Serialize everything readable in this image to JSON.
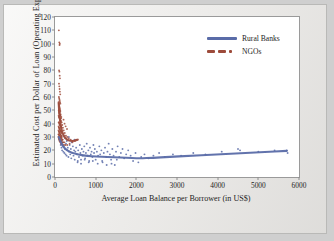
{
  "chart_data": {
    "type": "scatter",
    "title": "",
    "xlabel": "Average Loan Balance per Borrower (in US$)",
    "ylabel": "Estimated Cost per Dollar of Loan (Operating Expense Ratio)",
    "xlim": [
      0,
      6000
    ],
    "ylim": [
      0,
      120
    ],
    "xticks": [
      0,
      1000,
      2000,
      3000,
      4000,
      5000,
      6000
    ],
    "yticks": [
      0,
      10,
      20,
      30,
      40,
      50,
      60,
      70,
      80,
      90,
      100,
      110,
      120
    ],
    "grid": false,
    "legend_position": "top-right",
    "legend": [
      {
        "name": "Rural Banks",
        "color": "#5a6ca8",
        "style": "solid-line"
      },
      {
        "name": "NGOs",
        "color": "#9d4b3b",
        "style": "dashed-line"
      }
    ],
    "series": [
      {
        "name": "Rural Banks",
        "color": "#5a6ca8",
        "marker": "dot",
        "points": [
          [
            120,
            27
          ],
          [
            140,
            24
          ],
          [
            160,
            22
          ],
          [
            175,
            20
          ],
          [
            190,
            26
          ],
          [
            205,
            19
          ],
          [
            215,
            23
          ],
          [
            230,
            18
          ],
          [
            245,
            21
          ],
          [
            260,
            17
          ],
          [
            270,
            25
          ],
          [
            285,
            16
          ],
          [
            300,
            20
          ],
          [
            315,
            22
          ],
          [
            330,
            15
          ],
          [
            345,
            19
          ],
          [
            360,
            24
          ],
          [
            375,
            17
          ],
          [
            390,
            21
          ],
          [
            400,
            14
          ],
          [
            420,
            18
          ],
          [
            440,
            23
          ],
          [
            455,
            16
          ],
          [
            470,
            20
          ],
          [
            485,
            13
          ],
          [
            500,
            19
          ],
          [
            520,
            22
          ],
          [
            540,
            17
          ],
          [
            555,
            11
          ],
          [
            570,
            20
          ],
          [
            590,
            15
          ],
          [
            610,
            24
          ],
          [
            625,
            18
          ],
          [
            640,
            13
          ],
          [
            660,
            21
          ],
          [
            680,
            16
          ],
          [
            700,
            19
          ],
          [
            720,
            23
          ],
          [
            740,
            14
          ],
          [
            760,
            18
          ],
          [
            780,
            25
          ],
          [
            800,
            16
          ],
          [
            820,
            20
          ],
          [
            840,
            12
          ],
          [
            860,
            22
          ],
          [
            880,
            17
          ],
          [
            900,
            19
          ],
          [
            920,
            15
          ],
          [
            945,
            24
          ],
          [
            960,
            18
          ],
          [
            980,
            21
          ],
          [
            1000,
            13
          ],
          [
            1030,
            19
          ],
          [
            1060,
            16
          ],
          [
            1090,
            23
          ],
          [
            1110,
            17
          ],
          [
            1140,
            20
          ],
          [
            1170,
            11
          ],
          [
            1200,
            18
          ],
          [
            1230,
            22
          ],
          [
            1260,
            15
          ],
          [
            1290,
            19
          ],
          [
            1320,
            25
          ],
          [
            1350,
            17
          ],
          [
            1380,
            13
          ],
          [
            1410,
            21
          ],
          [
            1440,
            16
          ],
          [
            1470,
            9
          ],
          [
            1500,
            19
          ],
          [
            1540,
            23
          ],
          [
            1580,
            15
          ],
          [
            1620,
            18
          ],
          [
            1660,
            21
          ],
          [
            1700,
            14
          ],
          [
            1750,
            17
          ],
          [
            1800,
            20
          ],
          [
            1860,
            16
          ],
          [
            1920,
            12
          ],
          [
            1980,
            18
          ],
          [
            2050,
            11
          ],
          [
            2120,
            15
          ],
          [
            2200,
            17
          ],
          [
            2300,
            14
          ],
          [
            2420,
            16
          ],
          [
            2560,
            18
          ],
          [
            2700,
            15
          ],
          [
            2900,
            17
          ],
          [
            3100,
            16
          ],
          [
            3400,
            18
          ],
          [
            3700,
            17
          ],
          [
            4100,
            19
          ],
          [
            4500,
            21
          ],
          [
            4550,
            20
          ],
          [
            5000,
            19
          ],
          [
            5400,
            20
          ],
          [
            5700,
            20
          ],
          [
            5720,
            18
          ],
          [
            150,
            30
          ],
          [
            180,
            28
          ],
          [
            210,
            31
          ],
          [
            250,
            29
          ],
          [
            290,
            27
          ],
          [
            340,
            30
          ],
          [
            410,
            26
          ],
          [
            480,
            28
          ],
          [
            560,
            12
          ],
          [
            640,
            10
          ],
          [
            730,
            13
          ],
          [
            830,
            11
          ],
          [
            930,
            12
          ],
          [
            1050,
            10
          ],
          [
            1160,
            12
          ],
          [
            1270,
            9
          ],
          [
            1390,
            10
          ],
          [
            1520,
            13
          ]
        ],
        "trend": {
          "type": "fitted-curve",
          "color": "#5a6ca8",
          "points": [
            [
              95,
              30
            ],
            [
              150,
              25.5
            ],
            [
              220,
              22
            ],
            [
              320,
              19.5
            ],
            [
              450,
              17.8
            ],
            [
              600,
              16.6
            ],
            [
              800,
              15.8
            ],
            [
              1000,
              15.3
            ],
            [
              1300,
              15.0
            ],
            [
              1600,
              14.6
            ],
            [
              1900,
              14.2
            ],
            [
              2100,
              14.0
            ],
            [
              2400,
              14.4
            ],
            [
              2800,
              15.1
            ],
            [
              3300,
              15.9
            ],
            [
              3900,
              16.8
            ],
            [
              4500,
              17.7
            ],
            [
              5100,
              18.7
            ],
            [
              5700,
              19.6
            ]
          ]
        }
      },
      {
        "name": "NGOs",
        "color": "#9d4b3b",
        "marker": "dot",
        "points": [
          [
            95,
            110
          ],
          [
            105,
            101
          ],
          [
            112,
            99
          ],
          [
            118,
            100
          ],
          [
            100,
            80
          ],
          [
            108,
            79
          ],
          [
            115,
            76
          ],
          [
            122,
            74
          ],
          [
            98,
            70
          ],
          [
            106,
            68
          ],
          [
            113,
            66
          ],
          [
            120,
            64
          ],
          [
            128,
            62
          ],
          [
            96,
            60
          ],
          [
            104,
            59
          ],
          [
            110,
            58
          ],
          [
            116,
            57
          ],
          [
            124,
            56
          ],
          [
            132,
            55
          ],
          [
            94,
            55
          ],
          [
            101,
            54
          ],
          [
            108,
            53
          ],
          [
            114,
            52
          ],
          [
            121,
            51
          ],
          [
            129,
            50
          ],
          [
            92,
            50
          ],
          [
            99,
            49
          ],
          [
            106,
            48
          ],
          [
            112,
            48
          ],
          [
            119,
            47
          ],
          [
            126,
            46
          ],
          [
            134,
            46
          ],
          [
            90,
            46
          ],
          [
            97,
            45
          ],
          [
            104,
            45
          ],
          [
            111,
            44
          ],
          [
            117,
            44
          ],
          [
            124,
            43
          ],
          [
            131,
            43
          ],
          [
            138,
            42
          ],
          [
            146,
            42
          ],
          [
            90,
            41
          ],
          [
            98,
            41
          ],
          [
            105,
            40
          ],
          [
            112,
            40
          ],
          [
            119,
            39
          ],
          [
            127,
            39
          ],
          [
            135,
            38
          ],
          [
            143,
            38
          ],
          [
            152,
            37
          ],
          [
            88,
            38
          ],
          [
            95,
            37
          ],
          [
            103,
            37
          ],
          [
            110,
            36
          ],
          [
            118,
            36
          ],
          [
            126,
            35
          ],
          [
            134,
            35
          ],
          [
            142,
            34
          ],
          [
            151,
            34
          ],
          [
            160,
            33
          ],
          [
            86,
            35
          ],
          [
            94,
            34
          ],
          [
            102,
            34
          ],
          [
            110,
            33
          ],
          [
            119,
            33
          ],
          [
            128,
            32
          ],
          [
            137,
            32
          ],
          [
            147,
            31
          ],
          [
            157,
            31
          ],
          [
            168,
            30
          ],
          [
            85,
            32
          ],
          [
            93,
            32
          ],
          [
            102,
            31
          ],
          [
            112,
            31
          ],
          [
            122,
            30
          ],
          [
            133,
            30
          ],
          [
            145,
            29
          ],
          [
            158,
            29
          ],
          [
            172,
            28
          ],
          [
            188,
            28
          ],
          [
            84,
            30
          ],
          [
            94,
            29
          ],
          [
            105,
            29
          ],
          [
            117,
            28
          ],
          [
            130,
            28
          ],
          [
            145,
            27
          ],
          [
            162,
            27
          ],
          [
            182,
            26
          ],
          [
            205,
            26
          ],
          [
            232,
            26
          ],
          [
            150,
            44
          ],
          [
            165,
            41
          ],
          [
            178,
            39
          ],
          [
            195,
            37
          ],
          [
            215,
            35
          ],
          [
            240,
            33
          ],
          [
            268,
            31
          ],
          [
            300,
            30
          ],
          [
            340,
            29
          ],
          [
            385,
            28
          ],
          [
            435,
            27
          ],
          [
            490,
            27
          ],
          [
            210,
            43
          ],
          [
            235,
            40
          ],
          [
            262,
            38
          ],
          [
            295,
            36
          ],
          [
            130,
            49
          ],
          [
            140,
            47
          ],
          [
            155,
            45
          ],
          [
            98,
            28
          ],
          [
            112,
            27
          ],
          [
            128,
            26
          ],
          [
            146,
            25
          ],
          [
            166,
            25
          ],
          [
            190,
            24
          ],
          [
            220,
            24
          ],
          [
            255,
            24
          ],
          [
            300,
            24
          ],
          [
            360,
            25
          ],
          [
            430,
            26
          ],
          [
            520,
            28
          ]
        ],
        "trend": {
          "type": "fitted-curve",
          "color": "#9d4b3b",
          "points": [
            [
              90,
              56
            ],
            [
              105,
              48
            ],
            [
              125,
              42
            ],
            [
              150,
              37
            ],
            [
              185,
              33
            ],
            [
              230,
              30
            ],
            [
              290,
              28
            ],
            [
              370,
              27
            ],
            [
              470,
              27
            ],
            [
              560,
              28
            ]
          ]
        }
      }
    ]
  }
}
